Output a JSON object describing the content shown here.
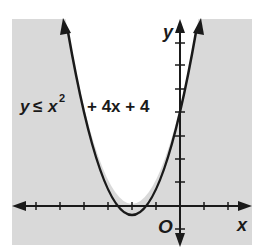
{
  "diagram": {
    "type": "graph-of-inequality",
    "inequality": {
      "lhs": "y",
      "symbol": "≤",
      "base": "x",
      "exponent": "2",
      "rest": "+ 4x + 4"
    },
    "axes": {
      "x_label": "x",
      "y_label": "y",
      "origin_label": "O"
    },
    "colors": {
      "shade": "#d9d9d9",
      "curve": "#1a1a1a",
      "background": "#ffffff"
    }
  }
}
